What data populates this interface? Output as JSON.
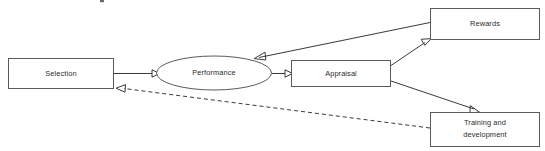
{
  "diagram": {
    "type": "flow-diagram",
    "colors": {
      "node_stroke": "#5b5b5b",
      "edge_stroke": "#3a3a3a",
      "text": "#2b2b2b",
      "background": "#ffffff"
    },
    "nodes": [
      {
        "id": "selection",
        "label": "Selection",
        "shape": "rectangle",
        "x": 8,
        "y": 58,
        "width": 105,
        "height": 31
      },
      {
        "id": "performance",
        "label": "Performance",
        "shape": "ellipse",
        "cx": 214,
        "cy": 73,
        "rx": 58,
        "ry": 17
      },
      {
        "id": "appraisal",
        "label": "Appraisal",
        "shape": "rectangle",
        "x": 291,
        "y": 60,
        "width": 100,
        "height": 27
      },
      {
        "id": "rewards",
        "label": "Rewards",
        "shape": "rectangle",
        "x": 430,
        "y": 8,
        "width": 110,
        "height": 32
      },
      {
        "id": "training",
        "label_line1": "Training and",
        "label_line2": "development",
        "label": "Training and development",
        "shape": "rectangle",
        "x": 430,
        "y": 112,
        "width": 110,
        "height": 35
      }
    ],
    "edges": [
      {
        "id": "selection-to-performance",
        "from": "selection",
        "to": "performance",
        "style": "solid",
        "arrowhead": "filled-triangle"
      },
      {
        "id": "performance-to-appraisal",
        "from": "performance",
        "to": "appraisal",
        "style": "solid",
        "arrowhead": "filled-triangle"
      },
      {
        "id": "appraisal-to-rewards",
        "from": "appraisal",
        "to": "rewards",
        "style": "solid",
        "arrowhead": "filled-triangle"
      },
      {
        "id": "appraisal-to-training",
        "from": "appraisal",
        "to": "training",
        "style": "solid",
        "arrowhead": "filled-triangle"
      },
      {
        "id": "rewards-to-performance",
        "from": "rewards",
        "to": "performance",
        "style": "solid",
        "arrowhead": "filled-triangle"
      },
      {
        "id": "training-to-selection",
        "from": "training",
        "to": "selection",
        "style": "dashed",
        "arrowhead": "filled-triangle"
      }
    ]
  }
}
